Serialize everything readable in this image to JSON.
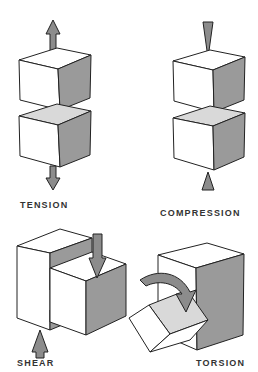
{
  "panels": [
    {
      "id": "tension",
      "label": "TENSION"
    },
    {
      "id": "compression",
      "label": "COMPRESSION"
    },
    {
      "id": "shear",
      "label": "SHEAR"
    },
    {
      "id": "torsion",
      "label": "TORSION"
    }
  ],
  "colors": {
    "face_light": "#ffffff",
    "face_top_shaded": "#d9d9d9",
    "face_side": "#9a9a9a",
    "arrow": "#8c8c8c",
    "outline": "#222222",
    "text": "#333333"
  }
}
